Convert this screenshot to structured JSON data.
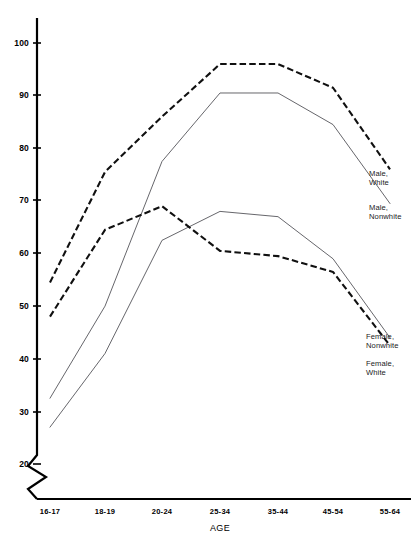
{
  "chart_data": {
    "type": "line",
    "title": "",
    "xlabel": "AGE",
    "ylabel": "",
    "categories": [
      "16-17",
      "18-19",
      "20-24",
      "25-34",
      "35-44",
      "45-54",
      "55-64"
    ],
    "ylim": [
      20,
      103
    ],
    "yticks": [
      20,
      30,
      40,
      50,
      60,
      70,
      80,
      90,
      100
    ],
    "ytick_labels": [
      "20",
      "30",
      "40",
      "50",
      "60",
      "70",
      "80",
      "90",
      "100"
    ],
    "axis_break": true,
    "grid": false,
    "legend_position": "inline-right",
    "series": [
      {
        "name": "Male, White",
        "label_line1": "Male,",
        "label_line2": "White",
        "style": "dashed",
        "color": "#101010",
        "values": [
          54.5,
          75.5,
          86.0,
          96.0,
          96.0,
          91.5,
          76.0
        ]
      },
      {
        "name": "Male, Nonwhite",
        "label_line1": "Male,",
        "label_line2": "Nonwhite",
        "style": "solid",
        "color": "#55555a",
        "values": [
          32.5,
          50.0,
          77.5,
          90.5,
          90.5,
          84.5,
          69.5
        ]
      },
      {
        "name": "Female, Nonwhite",
        "label_line1": "Female,",
        "label_line2": "Nonwhite",
        "style": "solid",
        "color": "#55555a",
        "values": [
          27.0,
          41.0,
          62.5,
          68.0,
          67.0,
          59.0,
          44.0
        ]
      },
      {
        "name": "Female, White",
        "label_line1": "Female,",
        "label_line2": "White",
        "style": "dashed",
        "color": "#101010",
        "values": [
          48.0,
          64.5,
          69.0,
          60.5,
          59.5,
          56.5,
          42.5
        ]
      }
    ]
  },
  "axes": {
    "x_label_text": "AGE"
  }
}
